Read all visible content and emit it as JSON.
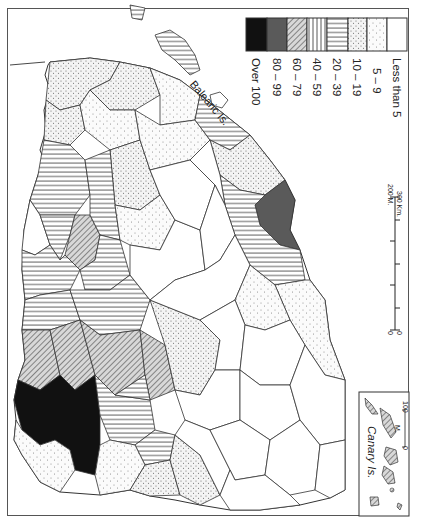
{
  "map": {
    "subject": "Provinces of Spain (choropleth, rotated 90°)",
    "orientation": "rotated 90 degrees clockwise",
    "labels": {
      "balearic": "Balearic Is.",
      "canary": "Canary Is."
    }
  },
  "legend": {
    "classes": [
      {
        "label": "Over 100",
        "pattern": "solid-black",
        "color": "#111111"
      },
      {
        "label": "80 – 99",
        "pattern": "solid-dark-grey",
        "color": "#5a5a5a"
      },
      {
        "label": "60 – 79",
        "pattern": "diagonal-hatch",
        "color": "#555555"
      },
      {
        "label": "40 – 59",
        "pattern": "vertical-lines",
        "color": "#444444"
      },
      {
        "label": "20 – 39",
        "pattern": "horizontal-lines",
        "color": "#444444"
      },
      {
        "label": "10 – 19",
        "pattern": "dense-dots",
        "color": "#777777"
      },
      {
        "label": "5 – 9",
        "pattern": "sparse-dots",
        "color": "#888888"
      },
      {
        "label": "Less than 5",
        "pattern": "blank",
        "color": "#ffffff"
      }
    ]
  },
  "scale_bar": {
    "miles_start": "0",
    "miles_end": "200 M.",
    "km_start": "0",
    "km_end": "300 Km."
  },
  "inset": {
    "title": "Canary Is.",
    "scale_start": "0",
    "scale_unit": "M.",
    "scale_end": "100"
  },
  "colors": {
    "border": "#555555",
    "province_line": "#333333",
    "over_100": "#111111",
    "80_99": "#5a5a5a"
  }
}
